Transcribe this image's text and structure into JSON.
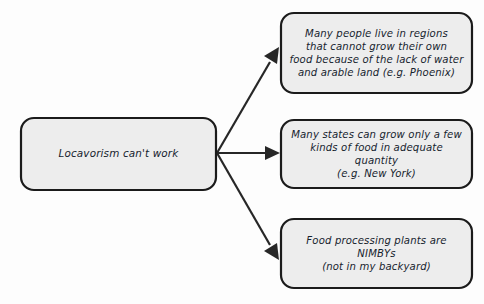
{
  "diagram": {
    "type": "flowchart",
    "orientation": "left-to-right",
    "style": {
      "background": "#fdfdfd",
      "node_fill": "#ededed",
      "node_stroke": "#1b1b1b",
      "connector_color": "#272727",
      "text_color": "#16232e"
    },
    "root": {
      "label": "Locavorism can't work"
    },
    "branches": [
      {
        "label": "Many people live in regions\nthat cannot grow their own\nfood because of the lack of water\nand arable land (e.g. Phoenix)"
      },
      {
        "label": "Many states can grow only a few\nkinds of food in adequate quantity\n(e.g. New York)"
      },
      {
        "label": "Food processing plants are NIMBYs\n(not in my backyard)"
      }
    ],
    "connectors": [
      {
        "name": "root-to-branch-0",
        "direction": "up-right"
      },
      {
        "name": "root-to-branch-1",
        "direction": "right"
      },
      {
        "name": "root-to-branch-2",
        "direction": "down-right"
      }
    ]
  }
}
